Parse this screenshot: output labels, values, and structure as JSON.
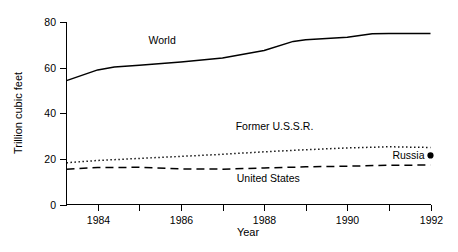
{
  "chart_data": {
    "type": "line",
    "title": "",
    "xlabel": "Year",
    "ylabel": "Trillion cubic feet",
    "xlim": [
      1983.25,
      1992
    ],
    "ylim": [
      0,
      80
    ],
    "xticks": [
      1984,
      1985,
      1986,
      1987,
      1988,
      1989,
      1990,
      1991,
      1992
    ],
    "xtick_labels": [
      "1984",
      "",
      "1986",
      "",
      "1988",
      "",
      "1990",
      "",
      "1992"
    ],
    "yticks": [
      0,
      20,
      40,
      60,
      80
    ],
    "ytick_labels": [
      "0",
      "20",
      "40",
      "60",
      "80"
    ],
    "grid": false,
    "legend": "inline-annotations",
    "series": [
      {
        "name": "World",
        "style": "solid",
        "label": "World",
        "label_x": 1985.55,
        "label_y": 70.5,
        "x": [
          1983.25,
          1984,
          1984.4,
          1985,
          1986,
          1987,
          1988,
          1988.7,
          1989,
          1990,
          1990.6,
          1991,
          1992
        ],
        "y": [
          54.3,
          59.0,
          60.3,
          61.0,
          62.5,
          64.2,
          67.5,
          71.5,
          72.2,
          73.3,
          74.8,
          75.0,
          75.0
        ]
      },
      {
        "name": "Former U.S.S.R.",
        "style": "dotted",
        "label": "Former U.S.S.R.",
        "label_x": 1988.25,
        "label_y": 32.5,
        "x": [
          1983.25,
          1984,
          1985,
          1986,
          1987,
          1988,
          1989,
          1990,
          1991,
          1992
        ],
        "y": [
          18.3,
          19.3,
          20.2,
          21.1,
          22.0,
          23.1,
          24.0,
          24.8,
          25.3,
          25.0
        ]
      },
      {
        "name": "United States",
        "style": "dashed",
        "label": "United States",
        "label_x": 1988.1,
        "label_y": 10.0,
        "x": [
          1983.25,
          1984,
          1985,
          1986,
          1987,
          1988,
          1989,
          1990,
          1991,
          1992
        ],
        "y": [
          15.5,
          16.2,
          16.3,
          15.6,
          15.5,
          16.0,
          16.5,
          16.8,
          17.2,
          17.3
        ]
      }
    ],
    "points": [
      {
        "name": "Russia",
        "label": "Russia",
        "x": 1992,
        "y": 21.5,
        "marker": "filled-circle"
      }
    ]
  },
  "colors": {
    "axis": "#000000",
    "text": "#000000",
    "series": "#000000",
    "background": "#ffffff"
  }
}
